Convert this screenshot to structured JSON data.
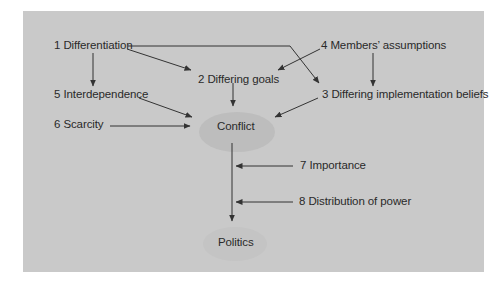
{
  "colors": {
    "panel": "#c9c9c9",
    "ellipse_conflict": "#bdbdbd",
    "ellipse_politics": "#c2c2c2",
    "text": "#2a2a2a",
    "line": "#333333"
  },
  "nodes": {
    "n1": "1 Differentiation",
    "n2": "2 Differing goals",
    "n3": "3 Differing implementation beliefs",
    "n4": "4 Members’ assumptions",
    "n5": "5 Interdependence",
    "n6": "6 Scarcity",
    "n7": "7 Importance",
    "n8": "8 Distribution of power",
    "conflict": "Conflict",
    "politics": "Politics"
  },
  "edges": [
    {
      "from": "1 Differentiation",
      "to": "2 Differing goals"
    },
    {
      "from": "1 Differentiation",
      "to": "3 Differing implementation beliefs"
    },
    {
      "from": "1 Differentiation",
      "to": "5 Interdependence"
    },
    {
      "from": "4 Members’ assumptions",
      "to": "2 Differing goals"
    },
    {
      "from": "4 Members’ assumptions",
      "to": "3 Differing implementation beliefs"
    },
    {
      "from": "2 Differing goals",
      "to": "Conflict"
    },
    {
      "from": "3 Differing implementation beliefs",
      "to": "Conflict"
    },
    {
      "from": "5 Interdependence",
      "to": "Conflict"
    },
    {
      "from": "6 Scarcity",
      "to": "Conflict"
    },
    {
      "from": "Conflict",
      "to": "Politics"
    },
    {
      "from": "7 Importance",
      "to": "Conflict→Politics link"
    },
    {
      "from": "8 Distribution of power",
      "to": "Conflict→Politics link"
    }
  ]
}
